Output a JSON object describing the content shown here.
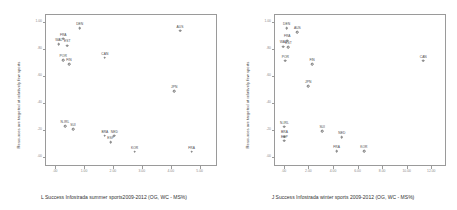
{
  "chart_data": [
    {
      "id": "summer",
      "type": "scatter",
      "title": "",
      "xlabel": "L Success Infostrada summer sports2009-2012 (OG, WC - MS%)",
      "ylabel": "Resources are targeted at relatively few sports",
      "xlim": [
        -0.35,
        5.6
      ],
      "ylim": [
        -0.07,
        1.06
      ],
      "grid": false,
      "legend": "none",
      "xticks": [
        ".00",
        "1.00",
        "2.00",
        "3.00",
        "4.00",
        "5.00"
      ],
      "xtickvalues": [
        0,
        1,
        2,
        3,
        4,
        5
      ],
      "yticks": [
        "1.00",
        ".80",
        ".60",
        ".40",
        ".20",
        ".00"
      ],
      "ytickvalues": [
        1.0,
        0.8,
        0.6,
        0.4,
        0.2,
        0.0
      ],
      "points": [
        {
          "label": "DEN",
          "x": 0.85,
          "y": 0.955
        },
        {
          "label": "AUS",
          "x": 4.32,
          "y": 0.935
        },
        {
          "label": "FRA",
          "x": 0.28,
          "y": 0.875
        },
        {
          "label": "WAL",
          "x": 0.13,
          "y": 0.835
        },
        {
          "label": "EST",
          "x": 0.42,
          "y": 0.825
        },
        {
          "label": "POR",
          "x": 0.28,
          "y": 0.715
        },
        {
          "label": "FIN",
          "x": 0.48,
          "y": 0.688
        },
        {
          "label": "CAN",
          "x": 1.72,
          "y": 0.735
        },
        {
          "label": "JPN",
          "x": 4.12,
          "y": 0.485
        },
        {
          "label": "N-IRL",
          "x": 0.34,
          "y": 0.225
        },
        {
          "label": "SUI",
          "x": 0.62,
          "y": 0.205
        },
        {
          "label": "BRA",
          "x": 1.72,
          "y": 0.155
        },
        {
          "label": "NED",
          "x": 2.05,
          "y": 0.155
        },
        {
          "label": "ESP",
          "x": 1.92,
          "y": 0.105
        },
        {
          "label": "KOR",
          "x": 2.75,
          "y": 0.035
        },
        {
          "label": "FRA",
          "x": 4.72,
          "y": 0.035
        }
      ]
    },
    {
      "id": "winter",
      "type": "scatter",
      "title": "",
      "xlabel": "J Success Infostrada winter sports 2009-2012 (OG, WC - MS%)",
      "ylabel": "Resources are targeted at relatively few sports",
      "xlim": [
        -0.8,
        13.2
      ],
      "ylim": [
        -0.07,
        1.06
      ],
      "grid": false,
      "legend": "none",
      "xticks": [
        ".00",
        "2.00",
        "4.00",
        "6.00",
        "8.00",
        "10.00",
        "12.00"
      ],
      "xtickvalues": [
        0,
        2,
        4,
        6,
        8,
        10,
        12
      ],
      "yticks": [
        "1.00",
        ".80",
        ".60",
        ".40",
        ".20",
        ".00"
      ],
      "ytickvalues": [
        1.0,
        0.8,
        0.6,
        0.4,
        0.2,
        0.0
      ],
      "points": [
        {
          "label": "DEN",
          "x": 0.22,
          "y": 0.955
        },
        {
          "label": "AUS",
          "x": 1.1,
          "y": 0.925
        },
        {
          "label": "FRA",
          "x": 0.28,
          "y": 0.862
        },
        {
          "label": "WAL",
          "x": -0.05,
          "y": 0.818
        },
        {
          "label": "EST",
          "x": 0.38,
          "y": 0.812
        },
        {
          "label": "POR",
          "x": 0.12,
          "y": 0.712
        },
        {
          "label": "FIN",
          "x": 2.3,
          "y": 0.688
        },
        {
          "label": "CAN",
          "x": 11.35,
          "y": 0.712
        },
        {
          "label": "JPN",
          "x": 1.98,
          "y": 0.522
        },
        {
          "label": "N-IRL",
          "x": 0.05,
          "y": 0.222
        },
        {
          "label": "SUI",
          "x": 3.12,
          "y": 0.19
        },
        {
          "label": "BRA",
          "x": 0.05,
          "y": 0.148
        },
        {
          "label": "ESP",
          "x": 0.05,
          "y": 0.118
        },
        {
          "label": "NED",
          "x": 4.72,
          "y": 0.142
        },
        {
          "label": "FRA",
          "x": 4.3,
          "y": 0.038
        },
        {
          "label": "KOR",
          "x": 6.52,
          "y": 0.038
        }
      ]
    }
  ],
  "colors": {
    "axis": "#9a9a9a",
    "marker": "#6e6e6e",
    "text": "#3a3a3a",
    "ticktext": "#8a8a8a",
    "background": "#ffffff"
  }
}
